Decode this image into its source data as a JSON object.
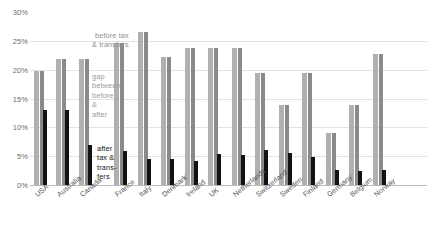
{
  "chart_data": {
    "type": "bar",
    "title": "",
    "subtitle": "",
    "xlabel": "",
    "ylabel": "",
    "ylim": [
      0,
      30
    ],
    "y_tick_labels": [
      "0%",
      "5%",
      "10%",
      "15%",
      "20%",
      "25%",
      "30%"
    ],
    "y_tick_values": [
      0,
      5,
      10,
      15,
      20,
      25,
      30
    ],
    "grid": true,
    "legend_position": "inside-plot",
    "categories": [
      "USA",
      "Australia",
      "Canada",
      "France",
      "Italy",
      "Denmark",
      "Ireland",
      "UK",
      "Netherlands",
      "Switzerland",
      "Sweden",
      "Finland",
      "Germany",
      "Belgium",
      "Norway"
    ],
    "series": [
      {
        "name": "before tax & transfers",
        "color": "#8a8a8a",
        "values": [
          19.8,
          21.8,
          21.8,
          24.6,
          26.5,
          22.2,
          23.8,
          23.8,
          23.8,
          19.5,
          13.8,
          19.5,
          9.0,
          13.8,
          22.8
        ]
      },
      {
        "name": "after tax & transfers",
        "color": "#121212",
        "values": [
          13.0,
          13.0,
          6.9,
          5.9,
          4.5,
          4.5,
          4.1,
          5.3,
          5.2,
          6.0,
          5.6,
          4.8,
          2.6,
          2.5,
          2.6
        ]
      }
    ],
    "annotations": [
      {
        "id": "before-tax",
        "text": "before tax\n& transfers"
      },
      {
        "id": "gap",
        "text": "gap\nbetween\nbefore\n&\nafter"
      },
      {
        "id": "after-tax",
        "text": "after\ntax &\ntrans-\nfers"
      }
    ]
  },
  "annotations": {
    "before_line1": "before tax",
    "before_line2": "& transfers",
    "gap_line1": "gap",
    "gap_line2": "between",
    "gap_line3": "before",
    "gap_line4": "&",
    "gap_line5": "after",
    "after_line1": "after",
    "after_line2": "tax &",
    "after_line3": "trans-",
    "after_line4": "fers"
  },
  "axis": {
    "t30": "30%",
    "t25": "25%",
    "t20": "20%",
    "t15": "15%",
    "t10": "10%",
    "t5": "5%",
    "t0": "0%"
  },
  "labels": {
    "c0": "USA",
    "c1": "Australia",
    "c2": "Canada",
    "c3": "France",
    "c4": "Italy",
    "c5": "Denmark",
    "c6": "Ireland",
    "c7": "UK",
    "c8": "Netherlands",
    "c9": "Switzerland",
    "c10": "Sweden",
    "c11": "Finland",
    "c12": "Germany",
    "c13": "Belgium",
    "c14": "Norway"
  }
}
